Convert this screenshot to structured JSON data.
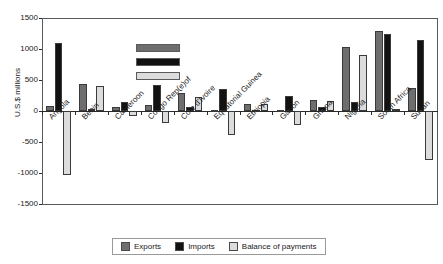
{
  "chart_data": {
    "type": "bar",
    "title": "",
    "xlabel": "",
    "ylabel": "U.S.$ millions",
    "ylim": [
      -1500,
      1500
    ],
    "yticks": [
      1500,
      1000,
      500,
      0,
      -500,
      -1000,
      -1500
    ],
    "grid": false,
    "legend_position": "bottom",
    "categories": [
      "Angola",
      "Benin",
      "Cameroon",
      "Congo Rep(e)of",
      "Cote d'Ivoire",
      "Equatorial Guinea",
      "Ethiopia",
      "Gabon",
      "Ghana",
      "Nigeria",
      "South Africa",
      "Sudan"
    ],
    "series": [
      {
        "name": "Exports",
        "color": "#6e6e6e",
        "values": [
          80,
          430,
          70,
          90,
          290,
          20,
          110,
          20,
          180,
          1040,
          1290,
          370
        ]
      },
      {
        "name": "Imports",
        "color": "#121212",
        "values": [
          1090,
          30,
          150,
          420,
          70,
          350,
          20,
          250,
          70,
          140,
          1250,
          1145
        ]
      },
      {
        "name": "Balance of payments",
        "color": "#dcdcdc",
        "values": [
          -1030,
          410,
          -80,
          -200,
          230,
          -390,
          110,
          -220,
          160,
          900,
          40,
          -790
        ]
      }
    ]
  },
  "legend": {
    "items": [
      {
        "label": "Exports",
        "color": "#6e6e6e"
      },
      {
        "label": "Imports",
        "color": "#121212"
      },
      {
        "label": "Balance of payments",
        "color": "#dcdcdc"
      }
    ]
  },
  "inner_legend": {
    "swatches": [
      "#6e6e6e",
      "#121212",
      "#dcdcdc"
    ]
  }
}
